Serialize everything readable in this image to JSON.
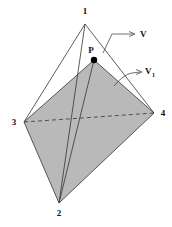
{
  "diagram": {
    "type": "tetrahedron",
    "vertices": [
      {
        "id": "1",
        "label": "1",
        "x": 85,
        "y": 24,
        "lx": 85,
        "ly": 14
      },
      {
        "id": "2",
        "label": "2",
        "x": 59,
        "y": 203,
        "lx": 59,
        "ly": 216
      },
      {
        "id": "3",
        "label": "3",
        "x": 24,
        "y": 122,
        "lx": 14,
        "ly": 125
      },
      {
        "id": "4",
        "label": "4",
        "x": 154,
        "y": 113,
        "lx": 163,
        "ly": 116
      }
    ],
    "point": {
      "label": "P",
      "x": 94,
      "y": 60,
      "lx": 91,
      "ly": 53
    },
    "labels": {
      "v": "V",
      "v1_main": "V",
      "v1_sub": "1"
    },
    "colors": {
      "shaded_face": "#b9b9b9",
      "line": "#333333",
      "point": "#000000"
    }
  }
}
